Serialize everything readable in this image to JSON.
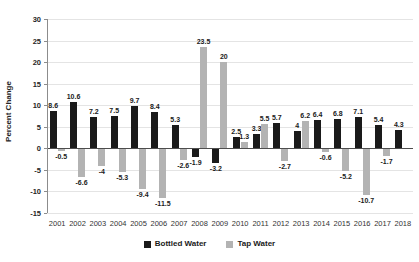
{
  "chart_data": {
    "type": "bar",
    "title": "",
    "xlabel": "",
    "ylabel": "Percent Change",
    "ylim": [
      -15,
      30
    ],
    "ytick_step": 5,
    "grid": true,
    "legend_position": "bottom",
    "categories": [
      "2001",
      "2002",
      "2003",
      "2004",
      "2005",
      "2006",
      "2007",
      "2008",
      "2009",
      "2010",
      "2011",
      "2012",
      "2013",
      "2014",
      "2015",
      "2016",
      "2017",
      "2018"
    ],
    "series": [
      {
        "name": "Bottled Water",
        "color": "#1a1a1a",
        "values": [
          8.6,
          10.6,
          7.2,
          7.5,
          9.7,
          8.4,
          5.3,
          -1.9,
          -3.2,
          2.5,
          3.3,
          5.7,
          4,
          6.4,
          6.8,
          7.1,
          5.4,
          4.3
        ]
      },
      {
        "name": "Tap Water",
        "color": "#b3b3b3",
        "values": [
          -0.5,
          -6.6,
          -4,
          -5.3,
          -9.4,
          -11.5,
          -2.6,
          23.5,
          20,
          1.3,
          5.5,
          -2.7,
          6.2,
          -0.6,
          -5.2,
          -10.7,
          -1.7,
          null
        ]
      }
    ]
  },
  "colors": {
    "gridline": "#e4e4e4",
    "zero_line": "#4d4d4d",
    "axis": "#8c8c8c",
    "label_text": "#1a1a1a"
  }
}
